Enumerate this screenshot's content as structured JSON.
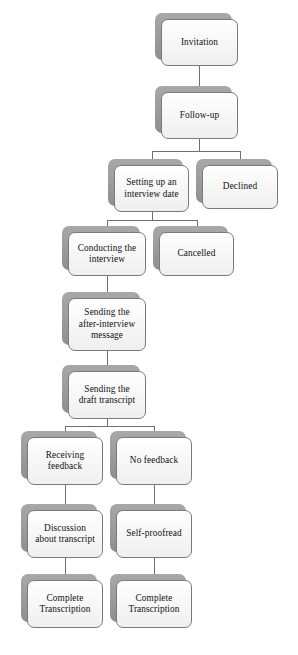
{
  "diagram": {
    "type": "flowchart",
    "orientation": "top-to-bottom",
    "background_color": "#ffffff",
    "node_fill_color": "#fbfbfb",
    "node_border_color": "#7a7a7a",
    "node_shadow_color": "#9a9a9a",
    "connector_color": "#6f6f6f",
    "text_color": "#111111"
  },
  "nodes": [
    {
      "id": "invitation",
      "label": "Invitation",
      "x": 161,
      "y": 19,
      "w": 77,
      "h": 47
    },
    {
      "id": "follow-up",
      "label": "Follow-up",
      "x": 161,
      "y": 92,
      "w": 77,
      "h": 47
    },
    {
      "id": "setting-up-interview",
      "label": "Setting up an\ninterview date",
      "x": 114,
      "y": 165,
      "w": 75,
      "h": 47
    },
    {
      "id": "declined",
      "label": "Declined",
      "x": 202,
      "y": 165,
      "w": 76,
      "h": 44
    },
    {
      "id": "conducting-interview",
      "label": "Conducting the\ninterview",
      "x": 68,
      "y": 232,
      "w": 78,
      "h": 44
    },
    {
      "id": "cancelled",
      "label": "Cancelled",
      "x": 159,
      "y": 232,
      "w": 75,
      "h": 44
    },
    {
      "id": "after-interview-message",
      "label": "Sending the\nafter-interview\nmessage",
      "x": 68,
      "y": 298,
      "w": 78,
      "h": 53
    },
    {
      "id": "draft-transcript",
      "label": "Sending the\ndraft transcript",
      "x": 68,
      "y": 371,
      "w": 78,
      "h": 48
    },
    {
      "id": "receiving-feedback",
      "label": "Receiving\nfeedback",
      "x": 27,
      "y": 437,
      "w": 76,
      "h": 48
    },
    {
      "id": "no-feedback",
      "label": "No feedback",
      "x": 116,
      "y": 437,
      "w": 76,
      "h": 48
    },
    {
      "id": "discussion-transcript",
      "label": "Discussion\nabout transcript",
      "x": 27,
      "y": 510,
      "w": 76,
      "h": 48
    },
    {
      "id": "self-proofread",
      "label": "Self-proofread",
      "x": 116,
      "y": 510,
      "w": 76,
      "h": 48
    },
    {
      "id": "complete-transcription-left",
      "label": "Complete\nTranscription",
      "x": 27,
      "y": 580,
      "w": 76,
      "h": 48
    },
    {
      "id": "complete-transcription-right",
      "label": "Complete\nTranscription",
      "x": 116,
      "y": 580,
      "w": 76,
      "h": 48
    }
  ],
  "connectors": [
    {
      "id": "invitation-to-follow-up",
      "from": "invitation",
      "to": "follow-up"
    },
    {
      "id": "follow-up-branch",
      "from": "follow-up",
      "to": "setting-up-interview, declined"
    },
    {
      "id": "setting-up-branch",
      "from": "setting-up-interview",
      "to": "conducting-interview, cancelled"
    },
    {
      "id": "conducting-to-message",
      "from": "conducting-interview",
      "to": "after-interview-message"
    },
    {
      "id": "message-to-draft",
      "from": "after-interview-message",
      "to": "draft-transcript"
    },
    {
      "id": "draft-branch",
      "from": "draft-transcript",
      "to": "receiving-feedback, no-feedback"
    },
    {
      "id": "receiving-to-discussion",
      "from": "receiving-feedback",
      "to": "discussion-transcript"
    },
    {
      "id": "discussion-to-complete",
      "from": "discussion-transcript",
      "to": "complete-transcription-left"
    },
    {
      "id": "no-feedback-to-self-proofread",
      "from": "no-feedback",
      "to": "self-proofread"
    },
    {
      "id": "self-proofread-to-complete",
      "from": "self-proofread",
      "to": "complete-transcription-right"
    }
  ],
  "connector_segments": [
    {
      "id": "seg-invitation-down",
      "orient": "v",
      "x": 199,
      "y": 66,
      "len": 26
    },
    {
      "id": "seg-followup-down",
      "orient": "v",
      "x": 199,
      "y": 139,
      "len": 12
    },
    {
      "id": "seg-followup-bar",
      "orient": "h",
      "x": 152,
      "y": 151,
      "len": 88
    },
    {
      "id": "seg-setting-drop",
      "orient": "v",
      "x": 152,
      "y": 151,
      "len": 14
    },
    {
      "id": "seg-declined-drop",
      "orient": "v",
      "x": 240,
      "y": 151,
      "len": 14
    },
    {
      "id": "seg-setting-down",
      "orient": "v",
      "x": 152,
      "y": 212,
      "len": 8
    },
    {
      "id": "seg-setting-bar",
      "orient": "h",
      "x": 107,
      "y": 220,
      "len": 90
    },
    {
      "id": "seg-conducting-drop",
      "orient": "v",
      "x": 107,
      "y": 220,
      "len": 12
    },
    {
      "id": "seg-cancelled-drop",
      "orient": "v",
      "x": 197,
      "y": 220,
      "len": 12
    },
    {
      "id": "seg-conducting-down",
      "orient": "v",
      "x": 107,
      "y": 276,
      "len": 22
    },
    {
      "id": "seg-message-down",
      "orient": "v",
      "x": 107,
      "y": 351,
      "len": 20
    },
    {
      "id": "seg-draft-down",
      "orient": "v",
      "x": 107,
      "y": 419,
      "len": 7
    },
    {
      "id": "seg-draft-bar",
      "orient": "h",
      "x": 65,
      "y": 426,
      "len": 89
    },
    {
      "id": "seg-receiving-drop",
      "orient": "v",
      "x": 65,
      "y": 426,
      "len": 11
    },
    {
      "id": "seg-nofeedback-drop",
      "orient": "v",
      "x": 154,
      "y": 426,
      "len": 11
    },
    {
      "id": "seg-receiving-down",
      "orient": "v",
      "x": 65,
      "y": 485,
      "len": 25
    },
    {
      "id": "seg-nofeedback-down",
      "orient": "v",
      "x": 154,
      "y": 485,
      "len": 25
    },
    {
      "id": "seg-discussion-down",
      "orient": "v",
      "x": 65,
      "y": 558,
      "len": 22
    },
    {
      "id": "seg-selfproofread-down",
      "orient": "v",
      "x": 154,
      "y": 558,
      "len": 22
    }
  ]
}
